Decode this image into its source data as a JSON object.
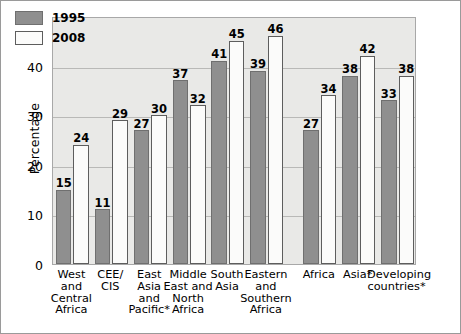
{
  "chart_data": {
    "type": "bar",
    "title": "",
    "xlabel": "",
    "ylabel": "Percentage",
    "ylim": [
      0,
      50
    ],
    "yticks": [
      0,
      10,
      20,
      30,
      40,
      50
    ],
    "grid": true,
    "legend_position": "top-left",
    "categories": [
      "West and Central Africa",
      "CEE/ CIS",
      "East Asia and Pacific*",
      "Middle East and North Africa",
      "South Asia",
      "Eastern and Southern Africa",
      "Africa",
      "Asia*",
      "Developing countries*"
    ],
    "category_lines": [
      [
        "West",
        "and",
        "Central",
        "Africa"
      ],
      [
        "CEE/",
        "CIS"
      ],
      [
        "East",
        "Asia",
        "and",
        "Pacific*"
      ],
      [
        "Middle",
        "East and",
        "North",
        "Africa"
      ],
      [
        "South",
        "Asia"
      ],
      [
        "Eastern",
        "and",
        "Southern",
        "Africa"
      ],
      [
        "Africa"
      ],
      [
        "Asia*"
      ],
      [
        "Developing",
        "countries*"
      ]
    ],
    "series": [
      {
        "name": "1995",
        "color": "#8f8f8f",
        "values": [
          15,
          11,
          27,
          37,
          41,
          39,
          27,
          38,
          33
        ]
      },
      {
        "name": "2008",
        "color": "#fbfbfa",
        "values": [
          24,
          29,
          30,
          32,
          45,
          46,
          34,
          42,
          38
        ]
      }
    ]
  },
  "legend": {
    "items": [
      {
        "label": "1995",
        "swatch": "s1995"
      },
      {
        "label": "2008",
        "swatch": "s2008"
      }
    ]
  }
}
